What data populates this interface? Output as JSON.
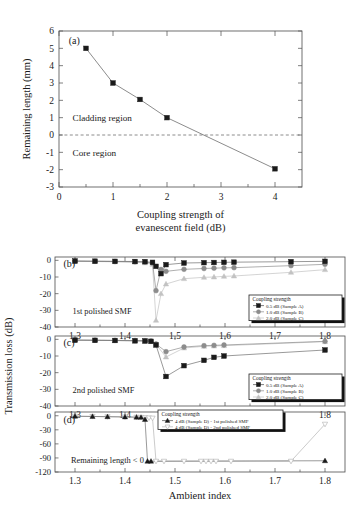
{
  "figure": {
    "panel_a_tag": "(a)",
    "panel_b_tag": "(b)",
    "panel_c_tag": "(c)",
    "panel_d_tag": "(d)",
    "shared_ylabel": "Transmission loss (dB)",
    "shared_xlabel": "Ambient index",
    "marker_colors": {
      "black": "#1a1a1a",
      "dark_gray": "#8c8c8c",
      "light_gray": "#c2c2c2",
      "line_gray": "#9a9a9a"
    }
  },
  "chart_data": [
    {
      "id": "panel_a",
      "type": "line",
      "title": "(a)",
      "xlabel": "Coupling strength of evanescent field (dB)",
      "ylabel": "Remaining length (mm)",
      "xlim": [
        0,
        4.5
      ],
      "ylim": [
        -3,
        6
      ],
      "xticks": [
        0,
        1,
        2,
        3,
        4
      ],
      "xtick_labels": [
        "0",
        "1",
        "2",
        "3",
        "4"
      ],
      "yticks": [
        -3,
        -2,
        -1,
        0,
        1,
        2,
        3,
        4,
        5,
        6
      ],
      "ytick_labels": [
        "-3",
        "-2",
        "-1",
        "0",
        "1",
        "2",
        "3",
        "4",
        "5",
        "6"
      ],
      "grid": false,
      "legend": "none",
      "annotations": [
        {
          "text": "Cladding region",
          "x": 0.25,
          "y": 1.0
        },
        {
          "text": "Core region",
          "x": 0.25,
          "y": -1.0
        },
        {
          "text": "(a)",
          "x": 0.18,
          "y": 5.45
        }
      ],
      "zero_line": 0,
      "series": [
        {
          "name": "Remaining length",
          "marker": "square",
          "color": "#1a1a1a",
          "x": [
            0.5,
            1.0,
            1.5,
            2.0,
            4.0
          ],
          "values": [
            5.0,
            3.0,
            2.05,
            1.0,
            -1.95
          ]
        }
      ]
    },
    {
      "id": "panel_b",
      "type": "line",
      "title": "(b)",
      "xlabel": "Ambient index",
      "ylabel": "Transmission loss (dB)",
      "xlim": [
        1.26,
        1.84
      ],
      "ylim": [
        -40,
        2
      ],
      "xticks": [
        1.3,
        1.4,
        1.5,
        1.6,
        1.7,
        1.8
      ],
      "xtick_labels": [
        "1.3",
        "1.4",
        "1.5",
        "1.6",
        "1.7",
        "1.8"
      ],
      "yticks": [
        0,
        -10,
        -20,
        -30,
        -40
      ],
      "ytick_labels": [
        "0",
        "-10",
        "-20",
        "-30",
        "-40"
      ],
      "grid": false,
      "legend": "lower-right",
      "legend_title": "Coupling strength",
      "annotations": [
        {
          "text": "1st polished SMF",
          "x": 1.295,
          "y": -30.5
        },
        {
          "text": "(b)",
          "x": 1.277,
          "y": -2.0
        }
      ],
      "series": [
        {
          "name": "0.5 dB (Sample A)",
          "marker": "square",
          "color": "#1a1a1a",
          "x": [
            1.3,
            1.34,
            1.38,
            1.42,
            1.44,
            1.455,
            1.462,
            1.472,
            1.482,
            1.518,
            1.558,
            1.578,
            1.598,
            1.618,
            1.732,
            1.8
          ],
          "values": [
            -0.4,
            -0.5,
            -0.6,
            -0.7,
            -0.8,
            -1.2,
            -3.6,
            -8.0,
            -2.6,
            -1.6,
            -1.4,
            -1.3,
            -1.2,
            -1.1,
            -0.8,
            -0.6
          ]
        },
        {
          "name": "1.0 dB (Sample B)",
          "marker": "circle",
          "color": "#8c8c8c",
          "x": [
            1.3,
            1.34,
            1.38,
            1.42,
            1.44,
            1.455,
            1.462,
            1.472,
            1.482,
            1.518,
            1.558,
            1.578,
            1.598,
            1.618,
            1.732,
            1.8
          ],
          "values": [
            -0.5,
            -0.6,
            -0.7,
            -0.9,
            -1.1,
            -1.6,
            -18.2,
            -5.5,
            -6.6,
            -5.4,
            -4.9,
            -4.7,
            -4.5,
            -4.4,
            -3.2,
            -2.4
          ]
        },
        {
          "name": "2.0 dB (Sample C)",
          "marker": "triangle",
          "color": "#c2c2c2",
          "x": [
            1.3,
            1.34,
            1.38,
            1.42,
            1.44,
            1.455,
            1.462,
            1.472,
            1.482,
            1.518,
            1.558,
            1.578,
            1.598,
            1.618,
            1.732,
            1.8
          ],
          "values": [
            -0.6,
            -0.7,
            -0.9,
            -1.1,
            -1.5,
            -2.4,
            -36.0,
            -20.0,
            -14.2,
            -11.0,
            -10.2,
            -10.0,
            -9.6,
            -9.4,
            -7.2,
            -5.6
          ]
        }
      ],
      "legend_entries": [
        {
          "label": "0.5 dB (Sample A)",
          "marker": "square",
          "color": "#1a1a1a"
        },
        {
          "label": "1.0 dB (Sample B)",
          "marker": "circle",
          "color": "#8c8c8c"
        },
        {
          "label": "2.0 dB (Sample C)",
          "marker": "triangle",
          "color": "#c2c2c2"
        }
      ]
    },
    {
      "id": "panel_c",
      "type": "line",
      "title": "(c)",
      "xlabel": "Ambient index",
      "ylabel": "Transmission loss (dB)",
      "xlim": [
        1.26,
        1.84
      ],
      "ylim": [
        -40,
        2
      ],
      "xticks": [
        1.3,
        1.4,
        1.5,
        1.6,
        1.7,
        1.8
      ],
      "xtick_labels": [
        "1.3",
        "1.4",
        "1.5",
        "1.6",
        "1.7",
        "1.8"
      ],
      "yticks": [
        0,
        -10,
        -20,
        -30,
        -40
      ],
      "ytick_labels": [
        "0",
        "-10",
        "-20",
        "-30",
        "-40"
      ],
      "grid": false,
      "legend": "lower-right",
      "legend_title": "Coupling strength",
      "annotations": [
        {
          "text": "2nd polished SMF",
          "x": 1.295,
          "y": -30.5
        },
        {
          "text": "(c)",
          "x": 1.277,
          "y": -2.0
        }
      ],
      "series": [
        {
          "name": "0.5 dB (Sample A)",
          "marker": "square",
          "color": "#1a1a1a",
          "x": [
            1.3,
            1.34,
            1.38,
            1.42,
            1.44,
            1.452,
            1.462,
            1.482,
            1.518,
            1.558,
            1.578,
            1.598,
            1.8
          ],
          "values": [
            -0.5,
            -0.6,
            -0.7,
            -0.9,
            -1.0,
            -1.2,
            -3.4,
            -22.3,
            -15.8,
            -12.6,
            -10.8,
            -10.0,
            -6.4
          ]
        },
        {
          "name": "1.0 dB (Sample B)",
          "marker": "circle",
          "color": "#8c8c8c",
          "x": [
            1.3,
            1.34,
            1.38,
            1.42,
            1.44,
            1.452,
            1.462,
            1.482,
            1.518,
            1.558,
            1.578,
            1.598,
            1.8
          ],
          "values": [
            -0.4,
            -0.5,
            -0.6,
            -0.7,
            -0.8,
            -1.0,
            -2.8,
            -7.4,
            -4.6,
            -3.8,
            -3.6,
            -3.4,
            -1.2
          ]
        },
        {
          "name": "2.0 dB (Sample C)",
          "marker": "triangle",
          "color": "#c2c2c2",
          "x": [
            1.3,
            1.34,
            1.38,
            1.42,
            1.44,
            1.452,
            1.462,
            1.482,
            1.518,
            1.558,
            1.578,
            1.598,
            1.8
          ],
          "values": [
            -0.5,
            -0.6,
            -0.7,
            -0.9,
            -1.0,
            -1.3,
            -3.0,
            -10.6,
            -5.2,
            -4.2,
            -4.0,
            -3.8,
            -1.4
          ]
        }
      ],
      "legend_entries": [
        {
          "label": "0.5 dB (Sample A)",
          "marker": "square",
          "color": "#1a1a1a"
        },
        {
          "label": "1.0 dB (Sample B)",
          "marker": "circle",
          "color": "#8c8c8c"
        },
        {
          "label": "2.0 dB (Sample C)",
          "marker": "triangle",
          "color": "#c2c2c2"
        }
      ]
    },
    {
      "id": "panel_d",
      "type": "line",
      "title": "(d)",
      "xlabel": "Ambient index",
      "ylabel": "Transmission loss (dB)",
      "xlim": [
        1.26,
        1.84
      ],
      "ylim": [
        -120,
        8
      ],
      "xticks": [
        1.3,
        1.4,
        1.5,
        1.6,
        1.7,
        1.8
      ],
      "xtick_labels": [
        "1.3",
        "1.4",
        "1.5",
        "1.6",
        "1.7",
        "1.8"
      ],
      "yticks": [
        0,
        -30,
        -60,
        -90,
        -120
      ],
      "ytick_labels": [
        "0",
        "-30",
        "-60",
        "-90",
        "-120"
      ],
      "grid": false,
      "legend": "upper-right",
      "legend_title": "Coupling strength",
      "annotations": [
        {
          "text": "Remaining length < 0",
          "x": 1.292,
          "y": -95
        },
        {
          "text": "(d)",
          "x": 1.277,
          "y": -8
        }
      ],
      "series": [
        {
          "name": "4 dB (Sample D) - 1st polished SMF",
          "marker": "triangle-up-filled",
          "color": "#1a1a1a",
          "x": [
            1.3,
            1.335,
            1.365,
            1.4,
            1.423,
            1.432,
            1.44,
            1.445,
            1.452,
            1.8
          ],
          "values": [
            -1.0,
            -1.5,
            -2.0,
            -2.5,
            -3.0,
            -3.5,
            -8.0,
            -97.0,
            -97.0,
            -96.0
          ]
        },
        {
          "name": "4 dB (Sample D) - 2nd polished SMF",
          "marker": "triangle-down-open",
          "color": "#b4b4b4",
          "x": [
            1.3,
            1.335,
            1.365,
            1.4,
            1.423,
            1.432,
            1.44,
            1.448,
            1.455,
            1.462,
            1.478,
            1.518,
            1.552,
            1.562,
            1.572,
            1.582,
            1.612,
            1.732,
            1.8
          ],
          "values": [
            -1.0,
            -1.5,
            -2.0,
            -2.5,
            -3.0,
            -3.5,
            -4.0,
            -4.5,
            -5.0,
            -97.0,
            -97.0,
            -97.0,
            -97.0,
            -97.0,
            -97.0,
            -97.0,
            -97.0,
            -97.0,
            -18.0
          ]
        }
      ],
      "legend_entries": [
        {
          "label": "4 dB (Sample D) - 1st polished SMF",
          "marker": "triangle-up-filled",
          "color": "#1a1a1a"
        },
        {
          "label": "4 dB (Sample D) - 2nd polished SMF",
          "marker": "triangle-down-open",
          "color": "#b4b4b4"
        }
      ]
    }
  ]
}
